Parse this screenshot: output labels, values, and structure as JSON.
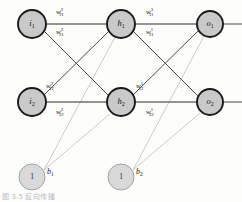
{
  "figure": {
    "type": "neural-network-diagram",
    "caption_fragment": "图 3-5  反向传播"
  },
  "layers": {
    "input": {
      "name": "input-layer",
      "nodes": [
        {
          "id": "i1",
          "base": "i",
          "sub": "1",
          "cx": 32,
          "cy": 24,
          "r": 14
        },
        {
          "id": "i2",
          "base": "i",
          "sub": "2",
          "cx": 32,
          "cy": 102,
          "r": 14
        }
      ]
    },
    "hidden": {
      "name": "hidden-layer",
      "nodes": [
        {
          "id": "h1",
          "base": "h",
          "sub": "1",
          "cx": 121,
          "cy": 24,
          "r": 14
        },
        {
          "id": "h2",
          "base": "h",
          "sub": "2",
          "cx": 121,
          "cy": 102,
          "r": 14
        }
      ]
    },
    "output": {
      "name": "output-layer",
      "nodes": [
        {
          "id": "o1",
          "base": "o",
          "sub": "1",
          "cx": 210,
          "cy": 24,
          "r": 13
        },
        {
          "id": "o2",
          "base": "o",
          "sub": "2",
          "cx": 210,
          "cy": 102,
          "r": 13
        }
      ]
    },
    "bias": {
      "name": "bias-layer",
      "nodes": [
        {
          "id": "bias1",
          "value": "1",
          "cx": 32,
          "cy": 177,
          "r": 13,
          "label_base": "b",
          "label_sub": "1",
          "label_x": 47,
          "label_y": 174
        },
        {
          "id": "bias2",
          "value": "1",
          "cx": 121,
          "cy": 177,
          "r": 13,
          "label_base": "b",
          "label_sub": "2",
          "label_x": 136,
          "label_y": 174
        }
      ]
    }
  },
  "weights": {
    "input_to_hidden": [
      {
        "id": "w2_11",
        "base": "w",
        "sup": "2",
        "sub": "11",
        "x": 56,
        "y": 14
      },
      {
        "id": "w2_21",
        "base": "w",
        "sup": "2",
        "sub": "21",
        "x": 56,
        "y": 34
      },
      {
        "id": "w2_12",
        "base": "w",
        "sup": "2",
        "sub": "12",
        "x": 46,
        "y": 88
      },
      {
        "id": "w2_22",
        "base": "w",
        "sup": "2",
        "sub": "22",
        "x": 56,
        "y": 114
      }
    ],
    "hidden_to_output": [
      {
        "id": "w3_11",
        "base": "w",
        "sup": "3",
        "sub": "11",
        "x": 146,
        "y": 14
      },
      {
        "id": "w1_21",
        "base": "w",
        "sup": "1",
        "sub": "21",
        "x": 146,
        "y": 34
      },
      {
        "id": "w1_12",
        "base": "w",
        "sup": "1",
        "sub": "12",
        "x": 136,
        "y": 88
      },
      {
        "id": "w1_22",
        "base": "w",
        "sup": "1",
        "sub": "22",
        "x": 146,
        "y": 114
      }
    ]
  },
  "edges": {
    "horizontal": [
      {
        "id": "i1-h1",
        "x1": 46,
        "y1": 24,
        "x2": 107,
        "y2": 24
      },
      {
        "id": "i2-h2",
        "x1": 46,
        "y1": 102,
        "x2": 107,
        "y2": 102
      },
      {
        "id": "h1-o1",
        "x1": 135,
        "y1": 24,
        "x2": 197,
        "y2": 24
      },
      {
        "id": "h2-o2",
        "x1": 135,
        "y1": 102,
        "x2": 197,
        "y2": 102
      }
    ],
    "cross": [
      {
        "id": "i1-h2",
        "x1": 44,
        "y1": 31,
        "x2": 109,
        "y2": 96
      },
      {
        "id": "i2-h1",
        "x1": 44,
        "y1": 95,
        "x2": 109,
        "y2": 31
      },
      {
        "id": "h1-o2",
        "x1": 133,
        "y1": 31,
        "x2": 198,
        "y2": 96
      },
      {
        "id": "h2-o1",
        "x1": 133,
        "y1": 95,
        "x2": 198,
        "y2": 31
      }
    ],
    "bias": [
      {
        "id": "b1-h1",
        "x1": 44,
        "y1": 170,
        "x2": 115,
        "y2": 37
      },
      {
        "id": "b1-h2",
        "x1": 44,
        "y1": 170,
        "x2": 110,
        "y2": 114
      },
      {
        "id": "b2-o1",
        "x1": 133,
        "y1": 170,
        "x2": 204,
        "y2": 36
      },
      {
        "id": "b2-o2",
        "x1": 133,
        "y1": 170,
        "x2": 200,
        "y2": 113
      }
    ],
    "stubs": [
      {
        "id": "o1-out",
        "x1": 223,
        "y1": 24,
        "x2": 242,
        "y2": 24
      },
      {
        "id": "o2-out",
        "x1": 223,
        "y1": 102,
        "x2": 242,
        "y2": 102
      }
    ]
  },
  "colors": {
    "node_fill": "#c9c9c9",
    "node_stroke": "#1a1a1a",
    "bias_fill": "#d9d9d9",
    "bias_stroke": "#9a9a9a",
    "edge": "#4a4a4a",
    "edge_horizontal": "#6f6f6f",
    "edge_bias": "#c2c2c2",
    "background": "#fdfdfc"
  }
}
